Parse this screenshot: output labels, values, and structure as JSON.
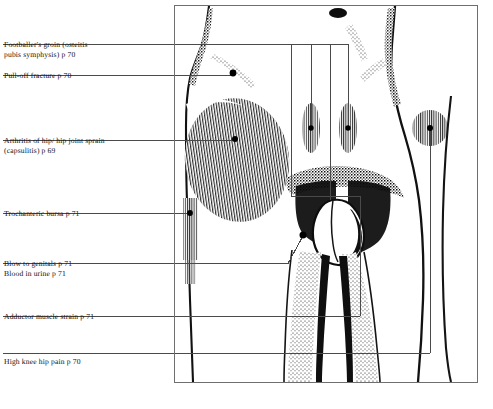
{
  "figure": {
    "frame": {
      "x": 174,
      "y": 5,
      "width": 304,
      "height": 378,
      "border_color": "#6f6f6f"
    },
    "ink_color": "#000000",
    "leader_color": "#4a4a4a",
    "background": "#ffffff"
  },
  "labels": [
    {
      "id": "footballers-groin",
      "text": "Footballer's groin (osteitis\npubis symphysis) p 70",
      "page": "p 70",
      "x": 4,
      "y": 46,
      "rule": {
        "x": 3,
        "y": 44,
        "width": 197
      },
      "leader_dot": {
        "x": 233,
        "y": 73
      }
    },
    {
      "id": "pull-off-fracture",
      "text": "Pull-off fracture p 70",
      "page": "p 70",
      "x": 4,
      "y": 77,
      "rule": {
        "x": 3,
        "y": 75,
        "width": 230
      },
      "leader_dot": {
        "x": 233,
        "y": 73
      }
    },
    {
      "id": "arthritis-of-hip",
      "text": "Arthritis of hip/ hip joint sprain\n(capsulitis) p 69",
      "page": "p 69",
      "x": 4,
      "y": 142,
      "rule": {
        "x": 3,
        "y": 140,
        "width": 232
      },
      "leader_dot": {
        "x": 235,
        "y": 139
      }
    },
    {
      "id": "trochanteric-bursa",
      "text": "Trochanteric bursa p 71",
      "page": "p 71",
      "x": 4,
      "y": 215,
      "rule": {
        "x": 3,
        "y": 213,
        "width": 188
      },
      "leader_dot": {
        "x": 190,
        "y": 213
      }
    },
    {
      "id": "blow-to-genitals",
      "text": "Blow to genitals p 71",
      "page": "p 71",
      "x": 4,
      "y": 265,
      "rule": {
        "x": 3,
        "y": 263,
        "width": 265
      },
      "leader_dot": {
        "x": 303,
        "y": 235
      }
    },
    {
      "id": "blood-in-urine",
      "text": "Blood in urine p 71",
      "page": "p 71",
      "x": 4,
      "y": 275,
      "rule": null,
      "leader_dot": null
    },
    {
      "id": "adductor-muscle-strain",
      "text": "Adductor muscle strain p 71",
      "page": "p 71",
      "x": 4,
      "y": 318,
      "rule": {
        "x": 3,
        "y": 316,
        "width": 358
      },
      "leader_dot": null
    },
    {
      "id": "high-knee-hip-pain",
      "text": "High knee hip pain p 70",
      "page": "p 70",
      "x": 4,
      "y": 363,
      "rule": {
        "x": 3,
        "y": 353,
        "width": 428
      },
      "leader_dot": {
        "x": 430,
        "y": 128
      }
    }
  ],
  "marker_sites": [
    {
      "id": "pubic-symphysis-marker",
      "cx": 233,
      "cy": 73,
      "r": 3.2,
      "shading": "solid"
    },
    {
      "id": "hip-joint-marker",
      "cx": 235,
      "cy": 139,
      "r": 3.0,
      "shading": "solid"
    },
    {
      "id": "trochanter-marker",
      "cx": 190,
      "cy": 213,
      "r": 2.8,
      "shading": "solid"
    },
    {
      "id": "genital-marker",
      "cx": 303,
      "cy": 235,
      "r": 3.4,
      "shading": "solid"
    },
    {
      "id": "adductor-left-marker",
      "cx": 311,
      "cy": 128,
      "r": 2.6,
      "shading": "hatched-oval"
    },
    {
      "id": "adductor-right-marker",
      "cx": 348,
      "cy": 128,
      "r": 2.6,
      "shading": "hatched-oval"
    },
    {
      "id": "knee-hip-marker",
      "cx": 430,
      "cy": 128,
      "r": 3.0,
      "shading": "hatched-circle"
    }
  ],
  "shaded_regions": [
    {
      "id": "hip-capsule-region",
      "style": "vertical-hatch-ellipse",
      "cx": 237,
      "cy": 160,
      "rx": 52,
      "ry": 62
    },
    {
      "id": "trochanteric-strip",
      "style": "vertical-hatch-strip",
      "x": 183,
      "y": 200,
      "width": 14,
      "height": 58
    },
    {
      "id": "adductor-oval-left",
      "style": "vertical-hatch-oval",
      "cx": 311,
      "cy": 128,
      "rx": 9,
      "ry": 25
    },
    {
      "id": "adductor-oval-right",
      "style": "vertical-hatch-oval",
      "cx": 348,
      "cy": 128,
      "rx": 9,
      "ry": 25
    },
    {
      "id": "knee-hip-circle",
      "style": "vertical-hatch-circle",
      "cx": 430,
      "cy": 128,
      "rx": 18,
      "ry": 18
    }
  ],
  "vertical_leaders": [
    {
      "id": "leader-a",
      "x": 291,
      "y1": 45,
      "y2": 196
    },
    {
      "id": "leader-b",
      "x": 311,
      "y1": 45,
      "y2": 128
    },
    {
      "id": "leader-c",
      "x": 330,
      "y1": 45,
      "y2": 200
    },
    {
      "id": "leader-d",
      "x": 348,
      "y1": 45,
      "y2": 128
    },
    {
      "id": "leader-adductor-riser",
      "x": 360,
      "y1": 196,
      "y2": 316
    },
    {
      "id": "leader-knee-drop",
      "x": 430,
      "y1": 128,
      "y2": 353
    }
  ],
  "anatomy": {
    "description": "Front view of lower torso, pelvis and upper thighs rendered in stipple and hatch line art",
    "parts": [
      "abdomen",
      "left-hip",
      "right-hip",
      "groin",
      "left-thigh",
      "right-thigh",
      "pubic-region"
    ]
  }
}
